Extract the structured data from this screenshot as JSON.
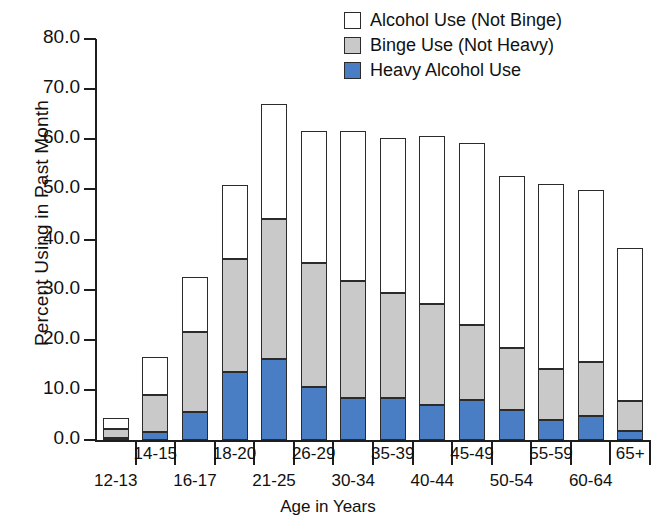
{
  "chart_data": {
    "type": "bar",
    "subtype": "stacked-bar",
    "title": "",
    "xlabel": "Age in Years",
    "ylabel": "Percent Using in Past Month",
    "ylim": [
      0.0,
      80.0
    ],
    "ytick_step": 10.0,
    "ytick_labels": [
      "0.0",
      "10.0",
      "20.0",
      "30.0",
      "40.0",
      "50.0",
      "60.0",
      "70.0",
      "80.0"
    ],
    "ytick_values": [
      0.0,
      10.0,
      20.0,
      30.0,
      40.0,
      50.0,
      60.0,
      70.0,
      80.0
    ],
    "grid": false,
    "legend_position": "top-right",
    "categories": [
      "12-13",
      "14-15",
      "16-17",
      "18-20",
      "21-25",
      "26-29",
      "30-34",
      "35-39",
      "40-44",
      "45-49",
      "50-54",
      "55-59",
      "60-64",
      "65+"
    ],
    "series": [
      {
        "name": "Heavy Alcohol Use",
        "color": "#4a7ec4",
        "values": [
          0.5,
          1.6,
          5.6,
          13.6,
          16.2,
          10.5,
          8.3,
          8.3,
          6.9,
          7.9,
          6.0,
          4.0,
          4.8,
          1.8
        ]
      },
      {
        "name": "Binge Use (Not Heavy)",
        "color": "#c9c9c9",
        "values": [
          1.7,
          7.4,
          15.9,
          22.6,
          27.8,
          24.9,
          23.5,
          21.0,
          20.3,
          15.1,
          12.3,
          10.2,
          10.7,
          5.9
        ]
      },
      {
        "name": "Alcohol Use (Not Binge)",
        "color": "#ffffff",
        "values": [
          2.1,
          7.5,
          11.1,
          14.7,
          23.1,
          26.2,
          29.9,
          30.9,
          33.4,
          36.2,
          34.4,
          36.9,
          34.3,
          30.6
        ]
      }
    ],
    "cumulative_tops": {
      "heavy": [
        0.5,
        1.6,
        5.6,
        13.6,
        16.2,
        10.5,
        8.3,
        8.3,
        6.9,
        7.9,
        6.0,
        4.0,
        4.8,
        1.8
      ],
      "binge": [
        2.2,
        9.0,
        21.5,
        36.2,
        44.0,
        35.4,
        31.8,
        29.3,
        27.2,
        23.0,
        18.3,
        14.2,
        15.5,
        7.7
      ],
      "total": [
        4.3,
        16.5,
        32.6,
        50.9,
        67.1,
        61.6,
        61.7,
        60.2,
        60.6,
        59.2,
        52.7,
        51.1,
        49.8,
        38.3
      ]
    }
  },
  "legend": {
    "items": [
      {
        "label": "Alcohol Use (Not Binge)",
        "swatch": "white"
      },
      {
        "label": "Binge Use (Not Heavy)",
        "swatch": "gray"
      },
      {
        "label": "Heavy Alcohol Use",
        "swatch": "blue"
      }
    ]
  },
  "colors": {
    "heavy": "#4a7ec4",
    "binge": "#c9c9c9",
    "alcohol": "#ffffff",
    "outline": "#2b2b2b",
    "axis": "#1d1d1d",
    "text": "#111111"
  }
}
